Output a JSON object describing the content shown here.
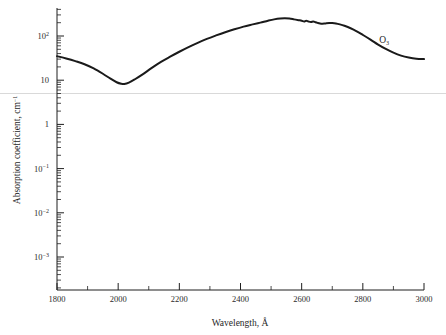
{
  "chart_data": {
    "type": "line",
    "title": "",
    "xlabel": "Wavelength, Å",
    "ylabel": "Absorption coefficient, cm⁻¹",
    "xlim": [
      1800,
      3000
    ],
    "ylim": [
      0.0003,
      400
    ],
    "yscale": "log",
    "xscale": "linear",
    "grid": false,
    "legend": "none",
    "annotations": [
      {
        "text": "O₃",
        "x": 2870,
        "y": 70,
        "name": "ozone-series-label"
      }
    ],
    "xticks": [
      1800,
      2000,
      2200,
      2400,
      2600,
      2800,
      3000
    ],
    "xtick_labels": [
      "1800",
      "2000",
      "2200",
      "2400",
      "2600",
      "2800",
      "3000"
    ],
    "xminor_ticks": [
      1900,
      2100,
      2300,
      2500,
      2700,
      2900
    ],
    "yticks": [
      100,
      10,
      1,
      0.1,
      0.01,
      0.001
    ],
    "ytick_labels": [
      "10²",
      "10",
      "1",
      "10⁻¹",
      "10⁻²",
      "10⁻³"
    ],
    "ytick_mantissa": [
      "10",
      "10",
      "1",
      "10",
      "10",
      "10"
    ],
    "ytick_exponent": [
      "2",
      "",
      "",
      "−1",
      "−2",
      "−3"
    ],
    "series": [
      {
        "name": "O₃",
        "color": "#1a1a1a",
        "linewidth": 2.0,
        "x": [
          1800,
          1830,
          1860,
          1890,
          1920,
          1950,
          1975,
          1995,
          2010,
          2020,
          2035,
          2055,
          2080,
          2110,
          2140,
          2170,
          2200,
          2230,
          2260,
          2290,
          2320,
          2350,
          2380,
          2410,
          2440,
          2465,
          2490,
          2510,
          2530,
          2545,
          2560,
          2575,
          2590,
          2600,
          2608,
          2615,
          2622,
          2630,
          2638,
          2645,
          2652,
          2660,
          2668,
          2678,
          2690,
          2700,
          2712,
          2725,
          2740,
          2760,
          2780,
          2800,
          2825,
          2850,
          2875,
          2900,
          2925,
          2950,
          2975,
          3000
        ],
        "y": [
          35.0,
          31.0,
          27.0,
          23.0,
          18.5,
          14.0,
          10.8,
          9.0,
          8.3,
          8.2,
          8.8,
          10.5,
          13.5,
          19.0,
          26.0,
          34.0,
          44.0,
          56.0,
          70.0,
          86.0,
          103.0,
          122.0,
          142.0,
          163.0,
          183.0,
          201.0,
          222.0,
          238.0,
          249.0,
          252.0,
          248.0,
          238.0,
          228.0,
          221.0,
          213.0,
          222.0,
          213.0,
          207.0,
          214.0,
          205.0,
          198.0,
          192.0,
          190.0,
          193.0,
          196.0,
          196.0,
          192.0,
          183.0,
          170.0,
          150.0,
          128.0,
          106.0,
          83.0,
          64.0,
          51.0,
          42.0,
          36.0,
          32.5,
          30.5,
          30.0
        ],
        "units": "cm^-1",
        "notes": "Hartley band of ozone with Huggins-band structure near 2600-2700 A"
      }
    ],
    "scan_artifact_line": {
      "present": true,
      "y_value": 5.0,
      "color": "#d9d9d9"
    }
  },
  "axes": {
    "x_axis_name": "wavelength-axis",
    "y_axis_name": "absorption-coefficient-axis"
  },
  "figure": {
    "background": "#ffffff",
    "foreground": "#1a1a1a"
  }
}
